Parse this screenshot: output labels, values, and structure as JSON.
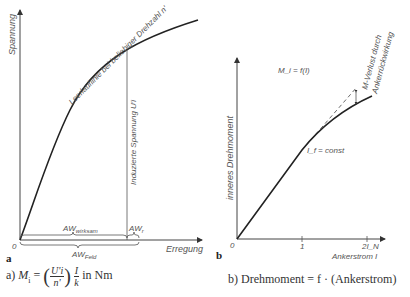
{
  "figure_a": {
    "panel_letter": "a",
    "y_axis_label": "Spannung",
    "x_axis_label": "Erregung",
    "origin_label": "0",
    "curve_label": "Leerlauflinie bei beliebiger Drehzahl n'",
    "vertical_line_label": "Induzierte Spannung U'i",
    "brace_effective_label": "AW",
    "brace_effective_sub": "wirksam",
    "brace_armature_label": "AW",
    "brace_armature_sub": "r",
    "brace_field_label": "AW",
    "brace_field_sub": "Feld",
    "caption_prefix": "a)",
    "caption_lhs": "M",
    "caption_lhs_sub": "i",
    "caption_eq": "=",
    "caption_frac1_num": "U'i",
    "caption_frac1_den": "n'",
    "caption_frac2_num": "I",
    "caption_frac2_den": "k",
    "caption_unit": "in  Nm"
  },
  "figure_b": {
    "panel_letter": "b",
    "y_axis_label": "inneres Drehmoment",
    "x_axis_label": "Ankerstrom I",
    "origin_label": "0",
    "x_ticks": [
      "1",
      "2I_N"
    ],
    "function_label": "M_i = f(I)",
    "curve_label": "I_f = const",
    "annotation_line1": "M-Verlust durch",
    "annotation_line2": "Ankerrückwirkung",
    "caption": "b) Drehmoment = f · (Ankerstrom)"
  }
}
